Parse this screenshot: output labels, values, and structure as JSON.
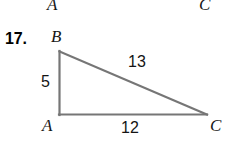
{
  "page": {
    "background": "#ffffff",
    "width": 229,
    "height": 153
  },
  "clipped_previous_figure": {
    "description": "labels from the figure above, cropped by the top edge",
    "labels": [
      {
        "text": "A",
        "x": 47,
        "y": -4
      },
      {
        "text": "C",
        "x": 199,
        "y": -4
      }
    ]
  },
  "exercise": {
    "number_label": "17.",
    "number_x": 5,
    "number_y": 31
  },
  "figure": {
    "type": "right-triangle",
    "stroke_color": "#767676",
    "stroke_width": 2.2,
    "vertices": [
      {
        "name": "B",
        "x": 59,
        "y": 51,
        "label": "B",
        "label_x": 51,
        "label_y": 28
      },
      {
        "name": "A",
        "x": 59,
        "y": 115,
        "label": "A",
        "label_x": 42,
        "label_y": 117
      },
      {
        "name": "C",
        "x": 207,
        "y": 115,
        "label": "C",
        "label_x": 210,
        "label_y": 117
      }
    ],
    "sides": [
      {
        "from": "A",
        "to": "B",
        "name": "leg-vertical",
        "measure": "5",
        "label_x": 41,
        "label_y": 74
      },
      {
        "from": "B",
        "to": "C",
        "name": "hypotenuse",
        "measure": "13",
        "label_x": 128,
        "label_y": 54
      },
      {
        "from": "A",
        "to": "C",
        "name": "leg-horizontal",
        "measure": "12",
        "label_x": 121,
        "label_y": 120
      }
    ]
  }
}
